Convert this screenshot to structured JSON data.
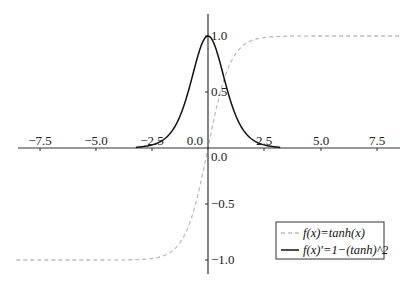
{
  "chart_data": {
    "type": "line",
    "title": "",
    "xlabel": "",
    "ylabel": "",
    "xlim": [
      -8.5,
      8.5
    ],
    "ylim": [
      -1.15,
      1.15
    ],
    "grid": false,
    "legend_position": "lower right",
    "x_ticks": [
      "-7.5",
      "-5.0",
      "-2.5",
      "0.0",
      "2.5",
      "5.0",
      "7.5"
    ],
    "x_tick_values": [
      -7.5,
      -5.0,
      -2.5,
      0.0,
      2.5,
      5.0,
      7.5
    ],
    "y_ticks": [
      "1.0",
      "0.5",
      "0.0",
      "-0.5",
      "-1.0"
    ],
    "y_tick_values": [
      1.0,
      0.5,
      0.0,
      -0.5,
      -1.0
    ],
    "series": [
      {
        "name": "f(x)=tanh(x)",
        "style": "dashed",
        "color": "#bbbbbb",
        "x": [
          -8.5,
          -5,
          -3,
          -2,
          -1.5,
          -1,
          -0.5,
          0,
          0.5,
          1,
          1.5,
          2,
          3,
          5,
          8.5
        ],
        "values": [
          -1.0,
          -0.9999,
          -0.9951,
          -0.964,
          -0.9051,
          -0.7616,
          -0.4621,
          0.0,
          0.4621,
          0.7616,
          0.9051,
          0.964,
          0.9951,
          0.9999,
          1.0
        ]
      },
      {
        "name": "f(x)'=1−(tanh)^2",
        "style": "solid",
        "color": "#111111",
        "x": [
          -3,
          -2.5,
          -2,
          -1.5,
          -1,
          -0.5,
          0,
          0.5,
          1,
          1.5,
          2,
          2.5,
          3
        ],
        "values": [
          0.0099,
          0.0266,
          0.0707,
          0.1807,
          0.42,
          0.7864,
          1.0,
          0.7864,
          0.42,
          0.1807,
          0.0707,
          0.0266,
          0.0099
        ]
      }
    ]
  },
  "legend": {
    "items": [
      {
        "label": "f(x)=tanh(x)"
      },
      {
        "label": "f(x)'=1−(tanh)^2"
      }
    ]
  },
  "axis_labels": {
    "x": [
      "−7.5",
      "−5.0",
      "−2.5",
      "0.0",
      "2.5",
      "5.0",
      "7.5"
    ],
    "y_pos": [
      "1.0",
      "0.5"
    ],
    "y_zero": "0.0",
    "y_neg": [
      "−0.5",
      "−1.0"
    ]
  }
}
